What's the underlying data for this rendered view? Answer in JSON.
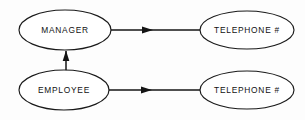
{
  "diagram": {
    "background_color": "#fdfdfd",
    "stroke_color": "#141414",
    "node_fill_color": "#ffffff",
    "text_color": "#111111",
    "nodes": [
      {
        "id": "manager",
        "label": "MANAGER",
        "shape": "ellipse",
        "cx": 65,
        "cy": 30,
        "rx": 46,
        "ry": 20
      },
      {
        "id": "telephone-manager",
        "label": "TELEPHONE #",
        "shape": "ellipse",
        "cx": 247,
        "cy": 30,
        "rx": 47,
        "ry": 19
      },
      {
        "id": "employee",
        "label": "EMPLOYEE",
        "shape": "ellipse",
        "cx": 64,
        "cy": 90,
        "rx": 45,
        "ry": 20
      },
      {
        "id": "telephone-employee",
        "label": "TELEPHONE #",
        "shape": "ellipse",
        "cx": 247,
        "cy": 90,
        "rx": 47,
        "ry": 19
      }
    ],
    "edges": [
      {
        "id": "manager-to-telephone",
        "from": "manager",
        "to": "telephone-manager",
        "direction": "right",
        "x1": 110,
        "y1": 30,
        "x2": 201,
        "y2": 30,
        "arrow_at_x": 150,
        "arrow_at_y": 30
      },
      {
        "id": "employee-to-telephone",
        "from": "employee",
        "to": "telephone-employee",
        "direction": "right",
        "x1": 108,
        "y1": 90,
        "x2": 201,
        "y2": 90,
        "arrow_at_x": 149,
        "arrow_at_y": 90
      },
      {
        "id": "employee-to-manager",
        "from": "employee",
        "to": "manager",
        "direction": "up",
        "x1": 66,
        "y1": 71,
        "x2": 66,
        "y2": 49,
        "arrow_at_x": 66,
        "arrow_at_y": 55
      }
    ]
  }
}
